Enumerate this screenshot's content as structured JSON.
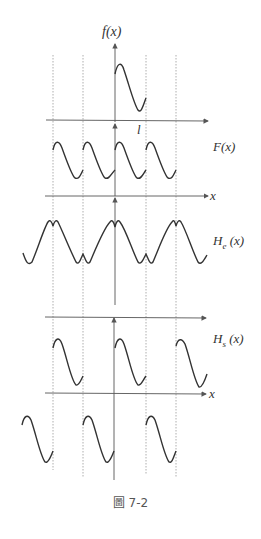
{
  "figure": {
    "caption": "圖 7-2",
    "panels": [
      {
        "id": "f",
        "label": "f(x)",
        "tick_label": "l"
      },
      {
        "id": "F",
        "label": "F(x)",
        "axis_label": "x"
      },
      {
        "id": "He",
        "label": "H_e (x)"
      },
      {
        "id": "Hs",
        "label": "H_s (x)",
        "axis_label": "x"
      }
    ],
    "labels": {
      "f": "f(x)",
      "tick_l": "l",
      "F": "F(x)",
      "x1": "x",
      "He_main": "H",
      "He_sub": "e",
      "He_arg": " (x)",
      "Hs_main": "H",
      "Hs_sub": "s",
      "Hs_arg": " (x)",
      "x2": "x"
    },
    "colors": {
      "curve": "#333333",
      "axis": "#555555",
      "guide": "#999999"
    }
  }
}
